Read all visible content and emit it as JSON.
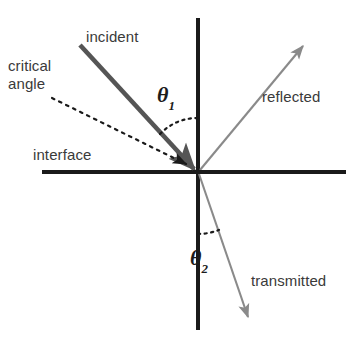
{
  "figure": {
    "labels": {
      "incident": "incident",
      "critical_angle_line1": "critical",
      "critical_angle_line2": "angle",
      "interface": "interface",
      "reflected": "reflected",
      "transmitted": "transmitted",
      "theta1_symbol": "θ",
      "theta1_subscript": "1",
      "theta2_symbol": "θ",
      "theta2_subscript": "2"
    },
    "colors": {
      "axis": "#1a1a1a",
      "incident_ray": "#555555",
      "reflected_ray": "#8a8a8a",
      "transmitted_ray": "#8a8a8a",
      "critical_dashed": "#1a1a1a",
      "arc": "#1a1a1a",
      "text": "#3a3a3a",
      "theta_text": "#1c1c1c",
      "background": "#ffffff"
    },
    "geometry": {
      "origin_x": 198,
      "origin_y": 172,
      "normal_axis_top_y": 18,
      "normal_axis_bottom_y": 330,
      "interface_axis_left_x": 42,
      "interface_axis_right_x": 346,
      "incident_start_x": 80,
      "incident_start_y": 45,
      "reflected_tip_x": 306,
      "reflected_tip_y": 42,
      "transmitted_tip_x": 250,
      "transmitted_tip_y": 321,
      "critical_start_x": 52,
      "critical_start_y": 98
    }
  }
}
